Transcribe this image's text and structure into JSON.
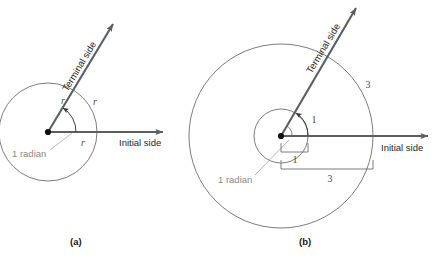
{
  "figure": {
    "background": "#ffffff",
    "width": 436,
    "height": 261
  },
  "colors": {
    "ray": "#5a5f63",
    "circle_stroke": "#6e6e6e",
    "text_dark": "#1f1f1f",
    "text_gray": "#8a8a8a",
    "label_italic": "#4a4a4a",
    "vertex": "#111111",
    "bracket": "#6e6e6e"
  },
  "panels": [
    {
      "id": "a",
      "caption": "(a)",
      "terminal_side_label": "Terminal side",
      "initial_side_label": "Initial side",
      "angle_label": "1 radian",
      "radius_labels": [
        "r",
        "r",
        "r"
      ],
      "center": {
        "x": 48,
        "y": 132
      },
      "radius": 49,
      "terminal_angle_deg": 57,
      "note": "One circle of radius r; arc length r subtends 1 radian"
    },
    {
      "id": "b",
      "caption": "(b)",
      "terminal_side_label": "Terminal side",
      "initial_side_label": "Initial side",
      "angle_label": "1 radian",
      "inner_labels": [
        "1",
        "1"
      ],
      "outer_labels": [
        "3",
        "3"
      ],
      "center": {
        "x": 281,
        "y": 136
      },
      "inner_radius": 27,
      "outer_radius": 92,
      "terminal_angle_deg": 57,
      "note": "Two concentric circles radius 1 and 3; arc lengths 1 and 3 subtend same 1 radian"
    }
  ]
}
